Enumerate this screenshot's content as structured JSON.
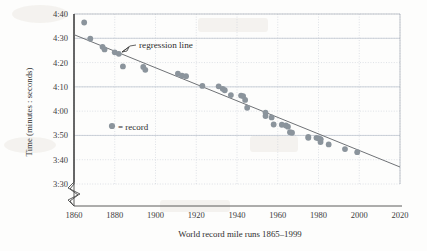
{
  "chart_data": {
    "type": "scatter",
    "title": "",
    "xlabel": "World record mile runs 1865–1999",
    "ylabel": "Time (minutes : seconds)",
    "xlim": [
      1860,
      2020
    ],
    "ylim_seconds": [
      210,
      280
    ],
    "ytick_labels": [
      "4:40",
      "4:30",
      "4:20",
      "4:10",
      "4:00",
      "3:50",
      "3:40",
      "3:30"
    ],
    "ytick_values_seconds": [
      280,
      270,
      260,
      250,
      240,
      230,
      220,
      210
    ],
    "xtick_labels": [
      "1860",
      "1880",
      "1900",
      "1920",
      "1940",
      "1960",
      "1980",
      "2000",
      "2020"
    ],
    "xtick_values": [
      1860,
      1880,
      1900,
      1920,
      1940,
      1960,
      1980,
      2000,
      2020
    ],
    "grid": true,
    "y_axis_break": true,
    "legend": {
      "position": "inside-left",
      "marker": "record-dot",
      "label": "= record",
      "series_name": "record"
    },
    "annotations": [
      {
        "name": "regression-line",
        "text": "regression line",
        "x": 1901,
        "y_seconds": 265
      }
    ],
    "series": [
      {
        "name": "record",
        "marker": "circle",
        "color": "#8b949c",
        "x": [
          1865,
          1868,
          1874,
          1875,
          1880,
          1882,
          1884,
          1894,
          1895,
          1911,
          1913,
          1915,
          1923,
          1931,
          1933,
          1934,
          1937,
          1942,
          1943,
          1944,
          1945,
          1954,
          1954,
          1957,
          1958,
          1962,
          1964,
          1965,
          1966,
          1967,
          1975,
          1975,
          1979,
          1980,
          1981,
          1981,
          1981,
          1985,
          1993,
          1999
        ],
        "y_seconds": [
          276.5,
          269.8,
          266.5,
          265.4,
          264.2,
          263.6,
          258.4,
          258.2,
          257.0,
          255.4,
          254.6,
          254.4,
          250.4,
          250.2,
          249.2,
          248.6,
          246.6,
          246.4,
          246.2,
          244.6,
          241.4,
          239.4,
          238.0,
          237.4,
          234.5,
          234.4,
          234.1,
          233.6,
          231.3,
          231.1,
          229.4,
          229.0,
          229.0,
          228.8,
          228.5,
          228.4,
          227.3,
          226.3,
          224.4,
          223.1
        ],
        "y_labels": [
          "4:36.5",
          "4:29.8",
          "4:26.5",
          "4:25.4",
          "4:24.2",
          "4:23.6",
          "4:18.4",
          "4:18.2",
          "4:17.0",
          "4:15.4",
          "4:14.6",
          "4:14.4",
          "4:10.4",
          "4:10.2",
          "4:09.2",
          "4:08.6",
          "4:06.6",
          "4:06.4",
          "4:06.2",
          "4:04.6",
          "4:01.4",
          "3:59.4",
          "3:58.0",
          "3:57.4",
          "3:54.5",
          "3:54.4",
          "3:54.1",
          "3:53.6",
          "3:51.3",
          "3:51.1",
          "3:49.4",
          "3:49.0",
          "3:49.0",
          "3:48.8",
          "3:48.5",
          "3:48.4",
          "3:47.3",
          "3:46.3",
          "3:44.4",
          "3:43.1"
        ]
      }
    ],
    "regression": {
      "name": "regression line",
      "x_start": 1860,
      "x_end": 2020,
      "y_start_seconds": 271.5,
      "y_end_seconds": 217.0,
      "color": "#6f7276"
    }
  }
}
